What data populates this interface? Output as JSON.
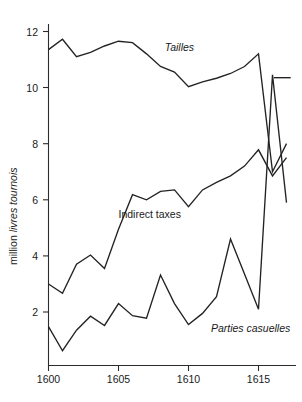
{
  "chart_data": {
    "type": "line",
    "title": "",
    "subtitle": "",
    "xlabel": "",
    "ylabel": "million livres tournois",
    "ylabel_plain": "million ",
    "ylabel_italic": "livres tournois",
    "xlim": [
      1600,
      1617.3
    ],
    "ylim": [
      0.3,
      12.6
    ],
    "grid": false,
    "legend_position": "inline-annotations",
    "x_ticks": [
      1600,
      1605,
      1610,
      1615
    ],
    "x_ticklabels": [
      "1600",
      "1605",
      "1610",
      "1615"
    ],
    "y_ticks": [
      2,
      4,
      6,
      8,
      10,
      12
    ],
    "y_ticklabels": [
      "2",
      "4",
      "6",
      "8",
      "10",
      "12"
    ],
    "x": [
      1600,
      1601,
      1602,
      1603,
      1604,
      1605,
      1606,
      1607,
      1608,
      1609,
      1610,
      1611,
      1612,
      1613,
      1614,
      1615,
      1616,
      1617
    ],
    "series": [
      {
        "name": "Tailles",
        "label_italic": true,
        "label_x": 1608.3,
        "label_y": 11.3,
        "values": [
          11.35,
          11.72,
          11.1,
          11.25,
          11.48,
          11.65,
          11.6,
          11.2,
          10.75,
          10.55,
          10.03,
          10.2,
          10.33,
          10.5,
          10.75,
          11.2,
          7.0,
          8.0
        ],
        "note": "after 1615 the line drops steeply; a separate short horizontal segment sits at about 10.35 at the right edge"
      },
      {
        "name": "Indirect taxes",
        "label_italic": false,
        "label_x": 1605.0,
        "label_y": 5.35,
        "values": [
          3.0,
          2.67,
          3.7,
          4.03,
          3.55,
          4.95,
          6.18,
          6.0,
          6.3,
          6.35,
          5.75,
          6.35,
          6.62,
          6.85,
          7.2,
          7.78,
          6.85,
          7.5
        ]
      },
      {
        "name": "Parties casuelles",
        "label_italic": true,
        "label_x": 1611.6,
        "label_y": 1.28,
        "values": [
          1.48,
          0.62,
          1.35,
          1.85,
          1.52,
          2.3,
          1.87,
          1.78,
          3.32,
          2.3,
          1.55,
          1.95,
          2.55,
          4.6,
          3.35,
          2.1,
          10.45,
          5.9
        ]
      }
    ],
    "annotations": [
      {
        "name": "tailles-flat-segment",
        "y": 10.35,
        "x_from": 1616.1,
        "x_to": 1617.3
      }
    ]
  }
}
